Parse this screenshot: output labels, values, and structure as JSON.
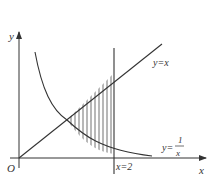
{
  "figure": {
    "axes": {
      "x_label": "x",
      "y_label": "y",
      "origin_label": "O"
    },
    "curves": [
      {
        "name": "line",
        "label": "y=x"
      },
      {
        "name": "hyperbola",
        "label_prefix": "y=",
        "label_num": "1",
        "label_den": "x"
      },
      {
        "name": "vertical",
        "label": "x=2"
      }
    ],
    "colors": {
      "stroke": "#333333",
      "background": "#ffffff"
    }
  }
}
